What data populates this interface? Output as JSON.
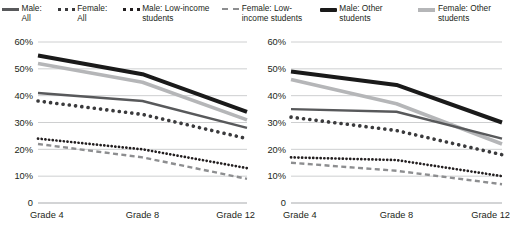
{
  "legend": {
    "items": [
      {
        "label": "Male: All",
        "style": "solid-medium-gray",
        "color": "#58595b",
        "name": "legend-male-all"
      },
      {
        "label": "Female: All",
        "style": "dotted-medium",
        "color": "#3a3a3c",
        "name": "legend-female-all"
      },
      {
        "label": "Male: Low-income students",
        "style": "dotted-dark-small",
        "color": "#231f20",
        "name": "legend-male-low-income"
      },
      {
        "label": "Female: Low-income students",
        "style": "dashed-gray",
        "color": "#8d8e90",
        "name": "legend-female-low-income"
      },
      {
        "label": "Male: Other students",
        "style": "solid-black-thick",
        "color": "#1a1a1a",
        "name": "legend-male-other"
      },
      {
        "label": "Female: Other students",
        "style": "solid-light-gray",
        "color": "#b5b6b8",
        "name": "legend-female-other"
      }
    ]
  },
  "chart_data": [
    {
      "type": "line",
      "name": "left-chart",
      "title": "",
      "xlabel": "",
      "ylabel": "",
      "categories": [
        "Grade 4",
        "Grade 8",
        "Grade 12"
      ],
      "ytick_labels": [
        "0",
        "10%",
        "20%",
        "30%",
        "40%",
        "50%",
        "60%"
      ],
      "ytick_values": [
        0,
        10,
        20,
        30,
        40,
        50,
        60
      ],
      "ylim": [
        0,
        60
      ],
      "grid": "horizontal",
      "legend_position": "top-shared",
      "series": [
        {
          "name": "Male: Other students",
          "values": [
            55,
            48,
            34
          ],
          "style": "solid-black-thick",
          "color": "#1a1a1a"
        },
        {
          "name": "Female: Other students",
          "values": [
            52,
            45,
            31
          ],
          "style": "solid-light-gray",
          "color": "#b5b6b8"
        },
        {
          "name": "Male: All",
          "values": [
            41,
            38,
            28
          ],
          "style": "solid-medium-gray",
          "color": "#58595b"
        },
        {
          "name": "Female: All",
          "values": [
            38,
            33,
            24
          ],
          "style": "dotted-medium",
          "color": "#3a3a3c"
        },
        {
          "name": "Male: Low-income students",
          "values": [
            24,
            20,
            13
          ],
          "style": "dotted-dark-small",
          "color": "#231f20"
        },
        {
          "name": "Female: Low-income students",
          "values": [
            22,
            17,
            9
          ],
          "style": "dashed-gray",
          "color": "#8d8e90"
        }
      ]
    },
    {
      "type": "line",
      "name": "right-chart",
      "title": "",
      "xlabel": "",
      "ylabel": "",
      "categories": [
        "Grade 4",
        "Grade 8",
        "Grade 12"
      ],
      "ytick_labels": [
        "0",
        "10%",
        "20%",
        "30%",
        "40%",
        "50%",
        "60%"
      ],
      "ytick_values": [
        0,
        10,
        20,
        30,
        40,
        50,
        60
      ],
      "ylim": [
        0,
        60
      ],
      "grid": "horizontal",
      "legend_position": "top-shared",
      "series": [
        {
          "name": "Male: Other students",
          "values": [
            49,
            44,
            30
          ],
          "style": "solid-black-thick",
          "color": "#1a1a1a"
        },
        {
          "name": "Female: Other students",
          "values": [
            46,
            37,
            22
          ],
          "style": "solid-light-gray",
          "color": "#b5b6b8"
        },
        {
          "name": "Male: All",
          "values": [
            35,
            34,
            24
          ],
          "style": "solid-medium-gray",
          "color": "#58595b"
        },
        {
          "name": "Female: All",
          "values": [
            32,
            27,
            18
          ],
          "style": "dotted-medium",
          "color": "#3a3a3c"
        },
        {
          "name": "Male: Low-income students",
          "values": [
            17,
            16,
            10
          ],
          "style": "dotted-dark-small",
          "color": "#231f20"
        },
        {
          "name": "Female: Low-income students",
          "values": [
            15,
            12,
            7
          ],
          "style": "dashed-gray",
          "color": "#8d8e90"
        }
      ]
    }
  ]
}
